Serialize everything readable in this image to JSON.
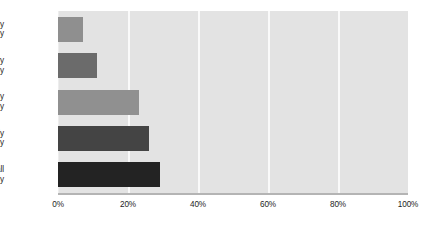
{
  "chart_data": {
    "type": "bar",
    "orientation": "horizontal",
    "title": "",
    "subtitle": "",
    "xlabel": "",
    "ylabel": "",
    "categories": [
      "Extremely likely",
      "Very likely",
      "Moderately likely",
      "Slightly likely",
      "Not at all likely"
    ],
    "category_lines": [
      [
        "Extremely",
        "likely"
      ],
      [
        "Very",
        "likely"
      ],
      [
        "Moderately",
        "likely"
      ],
      [
        "Slightly",
        "likely"
      ],
      [
        "Not at all",
        "likely"
      ]
    ],
    "values": [
      7,
      11,
      23,
      26,
      29
    ],
    "value_labels": [
      "7%",
      "11%",
      "23%",
      "26%",
      "29%"
    ],
    "bar_colors": [
      "#8f8f8f",
      "#6b6b6b",
      "#909090",
      "#444444",
      "#232323"
    ],
    "xlim": [
      0,
      100
    ],
    "ylim": null,
    "xticks": [
      0,
      20,
      40,
      60,
      80,
      100
    ],
    "xtick_labels": [
      "0%",
      "20%",
      "40%",
      "60%",
      "80%",
      "100%"
    ],
    "grid": true,
    "grid_axis": "x",
    "grid_color": "#fafafa",
    "plot_background": "#e3e3e3",
    "page_background": "#ffffff",
    "axis_line_color": "#b4b4b4",
    "text_color": "#1c1c1c",
    "legend": null,
    "legend_position": "none",
    "annotations": []
  }
}
